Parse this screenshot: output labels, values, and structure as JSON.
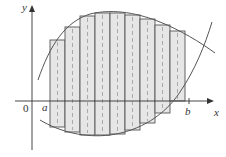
{
  "diagram": {
    "labels": {
      "y_axis": "y",
      "x_axis": "x",
      "origin": "0",
      "a": "a",
      "b": "b"
    },
    "colors": {
      "rect_fill": "#e6e6e6",
      "rect_stroke": "#555555",
      "curve": "#555555",
      "axis": "#333333",
      "midline": "#ffffff"
    },
    "rectangles": [
      {
        "x": 50,
        "top": 40,
        "bottom": 127
      },
      {
        "x": 65,
        "top": 27,
        "bottom": 132
      },
      {
        "x": 80,
        "top": 16,
        "bottom": 135
      },
      {
        "x": 95,
        "top": 13,
        "bottom": 135
      },
      {
        "x": 110,
        "top": 13,
        "bottom": 134
      },
      {
        "x": 125,
        "top": 15,
        "bottom": 130
      },
      {
        "x": 140,
        "top": 19,
        "bottom": 123
      },
      {
        "x": 155,
        "top": 25,
        "bottom": 113
      },
      {
        "x": 170,
        "top": 31,
        "bottom": 101
      }
    ],
    "rect_width": 15
  }
}
